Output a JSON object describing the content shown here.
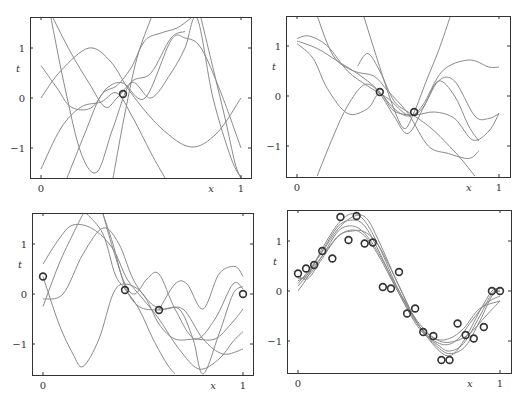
{
  "chart_data": [
    {
      "type": "line",
      "panel": "top-left",
      "title": "",
      "xlabel": "x",
      "ylabel": "t",
      "xlim": [
        -0.05,
        1.05
      ],
      "ylim": [
        -1.6,
        1.6
      ],
      "xticks": [
        "0",
        "1"
      ],
      "yticks": [
        "−1",
        "0",
        "1"
      ],
      "grid": false,
      "legend": null,
      "points": [
        [
          0.41,
          0.08
        ]
      ],
      "series": [
        {
          "name": "sample 1",
          "x": [
            0,
            0.1,
            0.24,
            0.35,
            0.45,
            0.6,
            0.75,
            0.88,
            1.0
          ],
          "y": [
            0.0,
            0.55,
            1.0,
            0.72,
            0.1,
            -0.6,
            -0.98,
            -0.7,
            0.0
          ]
        },
        {
          "name": "sample 2",
          "x": [
            0,
            0.08,
            0.15,
            0.25,
            0.33,
            0.41,
            0.52,
            0.65,
            0.72,
            0.8,
            0.9,
            1.0
          ],
          "y": [
            0.65,
            0.2,
            -0.18,
            -0.2,
            0.2,
            0.3,
            0.0,
            1.15,
            1.2,
            1.0,
            0.1,
            -1.0
          ]
        },
        {
          "name": "sample 3",
          "x": [
            0,
            0.1,
            0.2,
            0.3,
            0.38,
            0.46,
            0.55,
            0.62
          ],
          "y": [
            -1.42,
            -0.6,
            -0.18,
            -0.08,
            0.1,
            -0.4,
            -1.1,
            -1.6
          ]
        },
        {
          "name": "sample 4",
          "x": [
            0.06,
            0.15,
            0.24,
            0.32,
            0.38,
            0.46,
            0.55,
            0.65,
            0.72
          ],
          "y": [
            1.6,
            0.9,
            0.3,
            -0.18,
            0.0,
            0.35,
            0.5,
            1.2,
            1.33
          ]
        },
        {
          "name": "sample 5",
          "x": [
            0.05,
            0.12,
            0.2,
            0.28,
            0.36,
            0.45,
            0.55,
            0.65,
            0.72,
            0.78,
            0.86,
            0.95,
            1.0
          ],
          "y": [
            1.6,
            0.2,
            -1.1,
            -1.48,
            -0.6,
            0.3,
            0.0,
            0.5,
            1.0,
            1.6,
            0.0,
            -1.2,
            -1.6
          ]
        },
        {
          "name": "sample 6",
          "x": [
            0.13,
            0.22,
            0.3,
            0.38,
            0.45,
            0.52,
            0.6,
            0.68,
            0.75
          ],
          "y": [
            -1.6,
            -0.7,
            0.05,
            0.25,
            0.6,
            1.15,
            1.3,
            1.4,
            1.6
          ]
        },
        {
          "name": "sample 7",
          "x": [
            0.8,
            0.86,
            0.92,
            0.97,
            1.0
          ],
          "y": [
            1.6,
            0.6,
            -0.4,
            -1.3,
            -1.6
          ]
        },
        {
          "name": "sample 8",
          "x": [
            0.36,
            0.42,
            0.48,
            0.55
          ],
          "y": [
            -1.6,
            -0.3,
            0.8,
            1.6
          ]
        }
      ]
    },
    {
      "type": "line",
      "panel": "top-right",
      "title": "",
      "xlabel": "x",
      "ylabel": "t",
      "xlim": [
        -0.05,
        1.05
      ],
      "ylim": [
        -1.6,
        1.6
      ],
      "xticks": [
        "0",
        "1"
      ],
      "yticks": [
        "−1",
        "0",
        "1"
      ],
      "grid": false,
      "legend": null,
      "points": [
        [
          0.41,
          0.08
        ],
        [
          0.58,
          -0.32
        ]
      ],
      "series": [
        {
          "name": "sample 1",
          "x": [
            0,
            0.06,
            0.15,
            0.25,
            0.35,
            0.45,
            0.55,
            0.62,
            0.72,
            0.85,
            0.95,
            1.0
          ],
          "y": [
            1.15,
            1.2,
            1.0,
            0.5,
            0.2,
            -0.05,
            -0.38,
            -0.2,
            0.5,
            0.72,
            0.58,
            0.58
          ]
        },
        {
          "name": "sample 2",
          "x": [
            0,
            0.08,
            0.15,
            0.25,
            0.35,
            0.41,
            0.48,
            0.58,
            0.68,
            0.78,
            0.87,
            0.95,
            1.0
          ],
          "y": [
            1.05,
            0.75,
            0.15,
            -0.35,
            -0.25,
            0.05,
            -0.3,
            -0.38,
            -0.32,
            -0.45,
            -0.88,
            -0.7,
            -0.35
          ]
        },
        {
          "name": "sample 3",
          "x": [
            0.1,
            0.18,
            0.28,
            0.38,
            0.45,
            0.55,
            0.65,
            0.75,
            0.85,
            0.9
          ],
          "y": [
            1.6,
            0.8,
            0.5,
            0.4,
            0.1,
            -0.35,
            -1.0,
            -1.15,
            -1.25,
            -1.1
          ]
        },
        {
          "name": "sample 4",
          "x": [
            0.1,
            0.18,
            0.25,
            0.33,
            0.4,
            0.48,
            0.55,
            0.63,
            0.7,
            0.78,
            0.85,
            0.9
          ],
          "y": [
            -1.6,
            -0.8,
            -0.2,
            0.22,
            0.1,
            -0.4,
            -0.75,
            -0.2,
            0.3,
            0.0,
            -0.6,
            -0.9
          ]
        },
        {
          "name": "sample 5",
          "x": [
            0,
            0.1,
            0.2,
            0.28,
            0.35,
            0.41,
            0.48,
            0.55,
            0.62,
            0.7,
            0.78,
            0.88,
            0.95,
            1.0
          ],
          "y": [
            1.1,
            0.95,
            0.7,
            0.5,
            0.3,
            0.08,
            -0.25,
            -0.4,
            -0.25,
            0.3,
            0.3,
            -0.4,
            -0.45,
            -0.35
          ]
        },
        {
          "name": "sample 6",
          "x": [
            0.3,
            0.35,
            0.41,
            0.48,
            0.55,
            0.6,
            0.68,
            0.8,
            0.88
          ],
          "y": [
            0.6,
            0.85,
            0.5,
            -0.1,
            -0.32,
            -0.45,
            -0.7,
            -1.2,
            -1.6
          ]
        },
        {
          "name": "sample 7",
          "x": [
            0.33,
            0.4,
            0.47,
            0.53,
            0.58,
            0.64,
            0.7,
            0.76
          ],
          "y": [
            1.6,
            0.7,
            -0.15,
            -0.65,
            -0.32,
            0.3,
            0.9,
            1.6
          ]
        }
      ]
    },
    {
      "type": "line",
      "panel": "bottom-left",
      "title": "",
      "xlabel": "x",
      "ylabel": "t",
      "xlim": [
        -0.05,
        1.05
      ],
      "ylim": [
        -1.6,
        1.6
      ],
      "xticks": [
        "0",
        "1"
      ],
      "yticks": [
        "−1",
        "0",
        "1"
      ],
      "grid": false,
      "legend": null,
      "points": [
        [
          0.0,
          0.35
        ],
        [
          0.41,
          0.08
        ],
        [
          0.58,
          -0.32
        ],
        [
          1.0,
          0.0
        ]
      ],
      "series": [
        {
          "name": "sample 1",
          "x": [
            0,
            0.08,
            0.15,
            0.25,
            0.35,
            0.42,
            0.5,
            0.58,
            0.68,
            0.78,
            0.88,
            0.95,
            1.0
          ],
          "y": [
            0.6,
            1.1,
            1.38,
            1.3,
            0.9,
            0.3,
            -0.1,
            -0.5,
            -1.1,
            -1.5,
            -1.3,
            -0.95,
            -0.75
          ]
        },
        {
          "name": "sample 2",
          "x": [
            0,
            0.1,
            0.2,
            0.3,
            0.38,
            0.45,
            0.53,
            0.6,
            0.7,
            0.8,
            0.9,
            1.0
          ],
          "y": [
            -0.1,
            0.0,
            0.8,
            1.32,
            1.0,
            0.3,
            -0.15,
            -0.3,
            -0.3,
            -0.9,
            -1.2,
            -1.1
          ]
        },
        {
          "name": "sample 3",
          "x": [
            0,
            0.08,
            0.15,
            0.2,
            0.28,
            0.35,
            0.41,
            0.5,
            0.58,
            0.66,
            0.76,
            0.86,
            0.94,
            1.0
          ],
          "y": [
            0.35,
            -0.6,
            -1.2,
            -1.45,
            -0.9,
            0.0,
            0.2,
            0.0,
            -0.6,
            -0.9,
            -0.9,
            -0.9,
            -0.6,
            -0.3
          ]
        },
        {
          "name": "sample 4",
          "x": [
            0,
            0.08,
            0.15,
            0.2
          ],
          "y": [
            -0.25,
            0.6,
            1.2,
            1.6
          ]
        },
        {
          "name": "sample 5",
          "x": [
            0.22,
            0.3,
            0.36,
            0.41,
            0.48,
            0.55,
            0.62,
            0.66
          ],
          "y": [
            1.6,
            1.2,
            0.4,
            0.1,
            -0.3,
            -0.9,
            -1.4,
            -1.6
          ]
        },
        {
          "name": "sample 6",
          "x": [
            0.3,
            0.35,
            0.41,
            0.46,
            0.52,
            0.58,
            0.66,
            0.76,
            0.86,
            0.95,
            1.0
          ],
          "y": [
            1.6,
            0.9,
            0.2,
            0.0,
            0.3,
            0.4,
            -0.3,
            -0.9,
            -0.5,
            0.2,
            0.1
          ]
        },
        {
          "name": "sample 7",
          "x": [
            0.3,
            0.35,
            0.41,
            0.48,
            0.58,
            0.68,
            0.75,
            0.8,
            0.88,
            0.95,
            1.0
          ],
          "y": [
            1.6,
            1.0,
            0.15,
            -0.25,
            -0.32,
            -0.3,
            -0.9,
            -1.6,
            -0.8,
            0.0,
            0.15
          ]
        },
        {
          "name": "sample 8",
          "x": [
            0.58,
            0.66,
            0.72,
            0.8,
            0.88,
            0.96,
            1.0
          ],
          "y": [
            -0.32,
            0.2,
            0.2,
            -0.3,
            0.4,
            0.55,
            0.35
          ]
        }
      ]
    },
    {
      "type": "line",
      "panel": "bottom-right",
      "title": "",
      "xlabel": "x",
      "ylabel": "t",
      "xlim": [
        -0.05,
        1.05
      ],
      "ylim": [
        -1.6,
        1.6
      ],
      "xticks": [
        "0",
        "1"
      ],
      "yticks": [
        "−1",
        "0",
        "1"
      ],
      "grid": false,
      "legend": null,
      "points": [
        [
          0.0,
          0.35
        ],
        [
          0.04,
          0.45
        ],
        [
          0.08,
          0.52
        ],
        [
          0.12,
          0.8
        ],
        [
          0.17,
          0.65
        ],
        [
          0.21,
          1.48
        ],
        [
          0.25,
          1.02
        ],
        [
          0.29,
          1.5
        ],
        [
          0.33,
          0.95
        ],
        [
          0.37,
          0.97
        ],
        [
          0.42,
          0.08
        ],
        [
          0.46,
          0.05
        ],
        [
          0.5,
          0.38
        ],
        [
          0.54,
          -0.45
        ],
        [
          0.58,
          -0.35
        ],
        [
          0.62,
          -0.82
        ],
        [
          0.67,
          -0.9
        ],
        [
          0.71,
          -1.38
        ],
        [
          0.75,
          -1.38
        ],
        [
          0.79,
          -0.65
        ],
        [
          0.83,
          -0.88
        ],
        [
          0.87,
          -0.95
        ],
        [
          0.92,
          -0.72
        ],
        [
          0.96,
          0.0
        ],
        [
          1.0,
          0.0
        ]
      ],
      "series": [
        {
          "name": "sample 1",
          "x": [
            0,
            0.05,
            0.12,
            0.2,
            0.27,
            0.33,
            0.4,
            0.5,
            0.6,
            0.7,
            0.76,
            0.82,
            0.9,
            0.96,
            1.0
          ],
          "y": [
            0.0,
            0.3,
            0.85,
            1.35,
            1.55,
            1.4,
            0.9,
            0.0,
            -0.7,
            -1.2,
            -1.28,
            -1.0,
            -0.4,
            0.0,
            0.05
          ]
        },
        {
          "name": "sample 2",
          "x": [
            0,
            0.05,
            0.12,
            0.2,
            0.27,
            0.33,
            0.4,
            0.5,
            0.6,
            0.7,
            0.78,
            0.85,
            0.93,
            1.0
          ],
          "y": [
            0.2,
            0.35,
            0.7,
            1.1,
            1.22,
            1.1,
            0.7,
            -0.05,
            -0.7,
            -1.0,
            -1.0,
            -0.85,
            -0.5,
            -0.2
          ]
        },
        {
          "name": "sample 3",
          "x": [
            0,
            0.05,
            0.12,
            0.2,
            0.27,
            0.33,
            0.4,
            0.5,
            0.6,
            0.7,
            0.75,
            0.82,
            0.9,
            0.96,
            1.0
          ],
          "y": [
            0.1,
            0.35,
            0.8,
            1.3,
            1.42,
            1.3,
            0.8,
            -0.05,
            -0.75,
            -1.1,
            -1.2,
            -1.05,
            -0.5,
            -0.05,
            0.0
          ]
        },
        {
          "name": "sample 4",
          "x": [
            0,
            0.05,
            0.12,
            0.2,
            0.27,
            0.33,
            0.4,
            0.5,
            0.6,
            0.68,
            0.75,
            0.82,
            0.9,
            1.0
          ],
          "y": [
            0.25,
            0.3,
            0.7,
            1.2,
            1.3,
            1.15,
            0.75,
            0.0,
            -0.65,
            -0.95,
            -0.95,
            -0.75,
            -0.35,
            -0.2
          ]
        },
        {
          "name": "sample 5",
          "x": [
            0,
            0.05,
            0.12,
            0.2,
            0.27,
            0.33,
            0.4,
            0.5,
            0.6,
            0.7,
            0.78,
            0.86,
            0.93,
            1.0
          ],
          "y": [
            0.3,
            0.25,
            0.65,
            1.1,
            1.2,
            1.18,
            0.9,
            0.1,
            -0.7,
            -1.05,
            -1.0,
            -0.6,
            -0.25,
            -0.1
          ]
        },
        {
          "name": "sample 6",
          "x": [
            0,
            0.05,
            0.12,
            0.2,
            0.28,
            0.34,
            0.4,
            0.5,
            0.6,
            0.7,
            0.76,
            0.83,
            0.9,
            0.96,
            1.0
          ],
          "y": [
            0.15,
            0.4,
            0.78,
            1.25,
            1.5,
            1.45,
            1.0,
            0.1,
            -0.7,
            -1.15,
            -1.25,
            -1.1,
            -0.6,
            -0.1,
            0.0
          ]
        }
      ]
    }
  ],
  "panels": [
    {
      "id": "top-left",
      "frame": [
        30,
        17,
        251,
        178
      ],
      "x0": 41,
      "x1": 241,
      "y0": 98,
      "y1": 48
    },
    {
      "id": "top-right",
      "frame": [
        286,
        16,
        510,
        177
      ],
      "x0": 297,
      "x1": 499,
      "y0": 96,
      "y1": 46
    },
    {
      "id": "bottom-left",
      "frame": [
        32,
        213,
        253,
        375
      ],
      "x0": 43,
      "x1": 243,
      "y0": 294,
      "y1": 244
    },
    {
      "id": "bottom-right",
      "frame": [
        287,
        210,
        511,
        373
      ],
      "x0": 298,
      "x1": 500,
      "y0": 291,
      "y1": 241
    }
  ],
  "labels": {
    "x_axis": "x",
    "y_axis": "t",
    "tick_x0": "0",
    "tick_x1": "1",
    "tick_y_neg1": "−1",
    "tick_y0": "0",
    "tick_y1": "1"
  },
  "colors": {
    "curve": "#8a8a8a",
    "frame": "#333333",
    "point": "#333333",
    "background": "#ffffff"
  }
}
